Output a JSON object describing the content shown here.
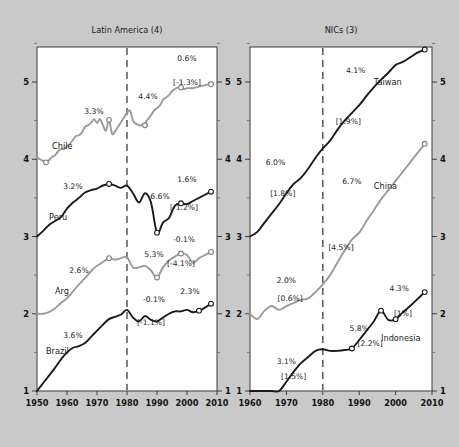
{
  "figure": {
    "background_color": "#c9c9c9",
    "panel_background": "#ffffff",
    "dark_series_color": "#1a1a1a",
    "gray_series_color": "#9a9a9a"
  },
  "chart_data": {
    "type": "line",
    "title": "",
    "xlabel": "",
    "ylabel": "",
    "grid": false,
    "legend_position": "inline-labels",
    "panels": [
      {
        "id": "latin-america",
        "title": "Latin America (4)",
        "xlim": [
          1950,
          2010
        ],
        "ylim": [
          1,
          5.6
        ],
        "xticks": [
          1950,
          1960,
          1970,
          1980,
          1990,
          2000,
          2010
        ],
        "xtick_labels": [
          "1950",
          "1960",
          "1970",
          "1980",
          "1990",
          "2000",
          "2010"
        ],
        "yticks": [
          1,
          2,
          3,
          4,
          5
        ],
        "ytick_labels": [
          "1",
          "2",
          "3",
          "4",
          "5"
        ],
        "reference_line_x": 1980,
        "series": [
          {
            "name": "Chile",
            "color": "#9a9a9a",
            "label": "Chile",
            "label_x": 1955,
            "label_y": 4.13,
            "annotations": [
              {
                "text": "3.3%",
                "x": 1969,
                "y": 4.58
              },
              {
                "text": "4.4%",
                "x": 1987,
                "y": 4.78
              },
              {
                "text": "0.6%",
                "x": 2000,
                "y": 5.27
              },
              {
                "text": "[-1.3%]",
                "x": 2000,
                "y": 4.96
              }
            ],
            "markers": [
              {
                "x": 1953,
                "y": 3.96
              },
              {
                "x": 1974,
                "y": 4.51
              },
              {
                "x": 1986,
                "y": 4.44
              },
              {
                "x": 1998,
                "y": 4.93
              },
              {
                "x": 2008,
                "y": 4.97
              }
            ],
            "x": [
              1950,
              1951,
              1952,
              1953,
              1954,
              1955,
              1956,
              1957,
              1958,
              1959,
              1960,
              1961,
              1962,
              1963,
              1964,
              1965,
              1966,
              1967,
              1968,
              1969,
              1970,
              1971,
              1972,
              1973,
              1974,
              1975,
              1976,
              1977,
              1978,
              1979,
              1980,
              1981,
              1982,
              1983,
              1984,
              1985,
              1986,
              1987,
              1988,
              1989,
              1990,
              1991,
              1992,
              1993,
              1994,
              1995,
              1996,
              1997,
              1998,
              1999,
              2000,
              2001,
              2002,
              2003,
              2004,
              2005,
              2006,
              2007,
              2008
            ],
            "y": [
              4.02,
              4.0,
              3.98,
              3.96,
              3.99,
              4.03,
              4.05,
              4.1,
              4.13,
              4.13,
              4.17,
              4.2,
              4.25,
              4.3,
              4.31,
              4.35,
              4.42,
              4.44,
              4.47,
              4.52,
              4.47,
              4.52,
              4.44,
              4.37,
              4.51,
              4.33,
              4.36,
              4.42,
              4.48,
              4.54,
              4.6,
              4.63,
              4.5,
              4.46,
              4.44,
              4.44,
              4.47,
              4.52,
              4.57,
              4.63,
              4.66,
              4.7,
              4.77,
              4.8,
              4.83,
              4.88,
              4.91,
              4.93,
              4.93,
              4.91,
              4.92,
              4.92,
              4.92,
              4.93,
              4.94,
              4.95,
              4.96,
              4.97,
              4.97
            ]
          },
          {
            "name": "Peru",
            "color": "#1a1a1a",
            "label": "Peru",
            "label_x": 1954,
            "label_y": 3.22,
            "annotations": [
              {
                "text": "3.2%",
                "x": 1962,
                "y": 3.62
              },
              {
                "text": "6.6%",
                "x": 1991,
                "y": 3.48
              },
              {
                "text": "1.6%",
                "x": 2000,
                "y": 3.71
              },
              {
                "text": "[-1.2%]",
                "x": 1999,
                "y": 3.34
              }
            ],
            "markers": [
              {
                "x": 1974,
                "y": 3.68
              },
              {
                "x": 1990,
                "y": 3.05
              },
              {
                "x": 1998,
                "y": 3.43
              },
              {
                "x": 2008,
                "y": 3.58
              }
            ],
            "x": [
              1950,
              1952,
              1954,
              1956,
              1958,
              1960,
              1962,
              1964,
              1966,
              1968,
              1970,
              1972,
              1974,
              1976,
              1978,
              1980,
              1982,
              1984,
              1986,
              1988,
              1990,
              1992,
              1994,
              1996,
              1998,
              2000,
              2002,
              2004,
              2006,
              2008
            ],
            "y": [
              3.0,
              3.07,
              3.15,
              3.2,
              3.25,
              3.36,
              3.44,
              3.5,
              3.57,
              3.6,
              3.62,
              3.66,
              3.68,
              3.66,
              3.63,
              3.66,
              3.56,
              3.44,
              3.56,
              3.44,
              3.05,
              3.18,
              3.24,
              3.4,
              3.43,
              3.42,
              3.46,
              3.5,
              3.54,
              3.58
            ]
          },
          {
            "name": "Arg",
            "color": "#9a9a9a",
            "label": "Arg",
            "label_x": 1956,
            "label_y": 2.25,
            "annotations": [
              {
                "text": "2.6%",
                "x": 1964,
                "y": 2.53
              },
              {
                "text": "5.3%",
                "x": 1989,
                "y": 2.74
              },
              {
                "text": "-0.1%",
                "x": 1999,
                "y": 2.93
              },
              {
                "text": "[-4.1%]",
                "x": 1998,
                "y": 2.62
              }
            ],
            "markers": [
              {
                "x": 1974,
                "y": 2.72
              },
              {
                "x": 1990,
                "y": 2.47
              },
              {
                "x": 1998,
                "y": 2.78
              },
              {
                "x": 2008,
                "y": 2.8
              }
            ],
            "x": [
              1950,
              1952,
              1954,
              1956,
              1958,
              1960,
              1962,
              1964,
              1966,
              1968,
              1970,
              1972,
              1974,
              1976,
              1978,
              1980,
              1982,
              1984,
              1986,
              1988,
              1990,
              1992,
              1994,
              1996,
              1998,
              2000,
              2002,
              2004,
              2006,
              2008
            ],
            "y": [
              2.0,
              2.0,
              2.02,
              2.07,
              2.14,
              2.2,
              2.29,
              2.38,
              2.46,
              2.55,
              2.62,
              2.67,
              2.72,
              2.7,
              2.72,
              2.73,
              2.6,
              2.6,
              2.62,
              2.56,
              2.47,
              2.6,
              2.69,
              2.74,
              2.78,
              2.76,
              2.66,
              2.72,
              2.76,
              2.8
            ]
          },
          {
            "name": "Brazil",
            "color": "#1a1a1a",
            "label": "Brazil",
            "label_x": 1953,
            "label_y": 1.48,
            "annotations": [
              {
                "text": "3.6%",
                "x": 1962,
                "y": 1.68
              },
              {
                "text": "-0.1%",
                "x": 1989,
                "y": 2.15
              },
              {
                "text": "2.3%",
                "x": 2001,
                "y": 2.25
              },
              {
                "text": "[-1.1%]",
                "x": 1988,
                "y": 1.86
              }
            ],
            "markers": [
              {
                "x": 2004,
                "y": 2.04
              },
              {
                "x": 2008,
                "y": 2.13
              }
            ],
            "x": [
              1950,
              1952,
              1954,
              1956,
              1958,
              1960,
              1962,
              1964,
              1966,
              1968,
              1970,
              1972,
              1974,
              1976,
              1978,
              1980,
              1982,
              1984,
              1986,
              1988,
              1990,
              1992,
              1994,
              1996,
              1998,
              2000,
              2002,
              2004,
              2006,
              2008
            ],
            "y": [
              1.0,
              1.1,
              1.2,
              1.3,
              1.41,
              1.5,
              1.56,
              1.58,
              1.62,
              1.7,
              1.78,
              1.86,
              1.93,
              1.96,
              1.99,
              2.05,
              1.95,
              1.9,
              1.97,
              1.92,
              1.9,
              1.95,
              2.0,
              2.03,
              2.03,
              2.05,
              2.02,
              2.04,
              2.08,
              2.13
            ]
          }
        ]
      },
      {
        "id": "nics",
        "title": "NICs (3)",
        "xlim": [
          1960,
          2010
        ],
        "ylim": [
          1,
          5.6
        ],
        "xticks": [
          1960,
          1970,
          1980,
          1990,
          2000,
          2010
        ],
        "xtick_labels": [
          "1960",
          "1970",
          "1980",
          "1990",
          "2000",
          "2010"
        ],
        "yticks": [
          1,
          2,
          3,
          4,
          5
        ],
        "ytick_labels": [
          "1",
          "2",
          "3",
          "4",
          "5"
        ],
        "reference_line_x": 1980,
        "series": [
          {
            "name": "Taiwan",
            "color": "#1a1a1a",
            "label": "Taiwan",
            "label_x": 1994,
            "label_y": 4.96,
            "annotations": [
              {
                "text": "4.1%",
                "x": 1989,
                "y": 5.12
              },
              {
                "text": "[1.9%]",
                "x": 1987,
                "y": 4.46
              }
            ],
            "markers": [
              {
                "x": 2008,
                "y": 5.42
              }
            ],
            "x": [
              1960,
              1962,
              1964,
              1966,
              1968,
              1970,
              1972,
              1974,
              1976,
              1978,
              1980,
              1982,
              1984,
              1986,
              1988,
              1990,
              1992,
              1994,
              1996,
              1998,
              2000,
              2002,
              2004,
              2006,
              2008
            ],
            "y": [
              3.0,
              3.06,
              3.18,
              3.3,
              3.42,
              3.56,
              3.68,
              3.76,
              3.88,
              4.02,
              4.14,
              4.24,
              4.38,
              4.5,
              4.6,
              4.7,
              4.82,
              4.93,
              5.03,
              5.12,
              5.22,
              5.26,
              5.32,
              5.38,
              5.42
            ]
          },
          {
            "name": "China",
            "color": "#9a9a9a",
            "label": "China",
            "label_x": 1994,
            "label_y": 3.62,
            "annotations": [
              {
                "text": "6.0%",
                "x": 1967,
                "y": 3.92
              },
              {
                "text": "[1.8%]",
                "x": 1969,
                "y": 3.52
              },
              {
                "text": "6.7%",
                "x": 1988,
                "y": 3.68
              },
              {
                "text": "[4.5%]",
                "x": 1985,
                "y": 2.82
              },
              {
                "text": "2.0%",
                "x": 1970,
                "y": 2.4
              },
              {
                "text": "[0.6%]",
                "x": 1971,
                "y": 2.16
              }
            ],
            "markers": [
              {
                "x": 2008,
                "y": 4.2
              }
            ],
            "x": [
              1960,
              1962,
              1964,
              1966,
              1968,
              1970,
              1972,
              1974,
              1976,
              1978,
              1980,
              1982,
              1984,
              1986,
              1988,
              1990,
              1992,
              1994,
              1996,
              1998,
              2000,
              2002,
              2004,
              2006,
              2008
            ],
            "y": [
              2.0,
              1.93,
              2.04,
              2.1,
              2.05,
              2.1,
              2.14,
              2.18,
              2.2,
              2.28,
              2.38,
              2.5,
              2.66,
              2.82,
              2.96,
              3.05,
              3.2,
              3.34,
              3.48,
              3.6,
              3.72,
              3.84,
              3.96,
              4.08,
              4.2
            ]
          },
          {
            "name": "Indonesia",
            "color": "#1a1a1a",
            "label": "Indonesia",
            "label_x": 1996,
            "label_y": 1.65,
            "annotations": [
              {
                "text": "3.1%",
                "x": 1970,
                "y": 1.35
              },
              {
                "text": "[1.5%]",
                "x": 1972,
                "y": 1.15
              },
              {
                "text": "5.8%",
                "x": 1990,
                "y": 1.78
              },
              {
                "text": "[2.2%]",
                "x": 1993,
                "y": 1.58
              },
              {
                "text": "4.3%",
                "x": 2001,
                "y": 2.29
              },
              {
                "text": "[1%]",
                "x": 2002,
                "y": 1.97
              }
            ],
            "markers": [
              {
                "x": 1988,
                "y": 1.55
              },
              {
                "x": 1996,
                "y": 2.04
              },
              {
                "x": 2000,
                "y": 1.93
              },
              {
                "x": 2008,
                "y": 2.28
              }
            ],
            "x": [
              1960,
              1962,
              1964,
              1966,
              1968,
              1970,
              1972,
              1974,
              1976,
              1978,
              1980,
              1982,
              1984,
              1986,
              1988,
              1990,
              1992,
              1994,
              1996,
              1998,
              2000,
              2002,
              2004,
              2006,
              2008
            ],
            "y": [
              1.0,
              1.0,
              1.0,
              1.0,
              1.0,
              1.12,
              1.25,
              1.36,
              1.44,
              1.52,
              1.54,
              1.52,
              1.52,
              1.53,
              1.55,
              1.66,
              1.78,
              1.9,
              2.04,
              1.92,
              1.93,
              2.02,
              2.1,
              2.19,
              2.28
            ]
          }
        ]
      }
    ]
  }
}
